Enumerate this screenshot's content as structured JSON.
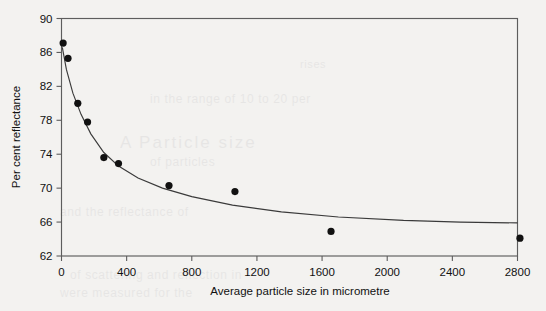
{
  "chart_data": {
    "type": "scatter",
    "title": "",
    "xlabel": "Average particle size in micrometre",
    "ylabel": "Per cent reflectance",
    "xlim": [
      0,
      2800
    ],
    "ylim": [
      62,
      90
    ],
    "xticks": [
      "0",
      "400",
      "800",
      "1200",
      "1600",
      "2000",
      "2400",
      "2800"
    ],
    "xtick_values": [
      0,
      400,
      800,
      1200,
      1600,
      2000,
      2400,
      2800
    ],
    "yticks": [
      "62",
      "66",
      "70",
      "74",
      "78",
      "82",
      "86",
      "90"
    ],
    "ytick_values": [
      62,
      66,
      70,
      74,
      78,
      82,
      86,
      90
    ],
    "grid": false,
    "legend": null,
    "series": [
      {
        "name": "Per cent reflectance vs average particle size",
        "marker": "filled-circle",
        "x": [
          10,
          40,
          100,
          160,
          260,
          350,
          660,
          1065,
          1655,
          2815
        ],
        "y": [
          87.1,
          85.3,
          80.0,
          77.8,
          73.6,
          72.9,
          70.3,
          69.6,
          64.9,
          64.1
        ],
        "points": [
          {
            "x": 10,
            "y": 87.1
          },
          {
            "x": 40,
            "y": 85.3
          },
          {
            "x": 100,
            "y": 80.0
          },
          {
            "x": 160,
            "y": 77.8
          },
          {
            "x": 260,
            "y": 73.6
          },
          {
            "x": 350,
            "y": 72.9
          },
          {
            "x": 660,
            "y": 70.3
          },
          {
            "x": 1065,
            "y": 69.6
          },
          {
            "x": 1655,
            "y": 64.9
          },
          {
            "x": 2815,
            "y": 64.1
          }
        ]
      },
      {
        "name": "fitted decay curve",
        "marker": "none",
        "curve": [
          {
            "x": 5,
            "y": 86.6
          },
          {
            "x": 30,
            "y": 84.0
          },
          {
            "x": 70,
            "y": 81.2
          },
          {
            "x": 120,
            "y": 78.7
          },
          {
            "x": 180,
            "y": 76.4
          },
          {
            "x": 260,
            "y": 74.2
          },
          {
            "x": 350,
            "y": 72.6
          },
          {
            "x": 470,
            "y": 71.2
          },
          {
            "x": 620,
            "y": 70.0
          },
          {
            "x": 800,
            "y": 69.0
          },
          {
            "x": 1050,
            "y": 68.0
          },
          {
            "x": 1350,
            "y": 67.2
          },
          {
            "x": 1700,
            "y": 66.6
          },
          {
            "x": 2100,
            "y": 66.2
          },
          {
            "x": 2450,
            "y": 66.0
          },
          {
            "x": 2800,
            "y": 65.9
          }
        ]
      }
    ]
  },
  "bleed_text": {
    "line1": "in the range of 10 to 20 per",
    "line2": "A  Particle  size",
    "line3": "of particles",
    "line4": "and the reflectance of",
    "line5": "of scattering and reflection in",
    "line6": "were measured for the",
    "line7": "rises"
  },
  "colors": {
    "background": "#f3f2f0",
    "axis": "#5d5d5d",
    "marker": "#111111",
    "curve": "#3a3a3a",
    "text": "#111111"
  }
}
